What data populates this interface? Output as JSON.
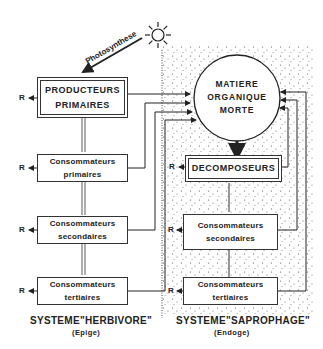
{
  "diagram": {
    "photosynthesis_label": "Photosynthese",
    "sun_icon": "sun-icon",
    "respiration_label": "R",
    "herbivore": {
      "title": "SYSTEME\"HERBIVORE\"",
      "subtitle": "(Epige)",
      "boxes": [
        {
          "line1": "PRODUCTEURS",
          "line2": "PRIMAIRES"
        },
        {
          "line1": "Consommateurs",
          "line2": "primaires"
        },
        {
          "line1": "Consommateurs",
          "line2": "secondaires"
        },
        {
          "line1": "Consommateurs",
          "line2": "tertiaires"
        }
      ]
    },
    "saprophage": {
      "title": "SYSTEME\"SAPROPHAGE\"",
      "subtitle": "(Endoge)",
      "circle": {
        "line1": "MATIERE",
        "line2": "ORGANIQUE",
        "line3": "MORTE"
      },
      "boxes": [
        {
          "line1": "DECOMPOSEURS"
        },
        {
          "line1": "Consommateurs",
          "line2": "secondaires"
        },
        {
          "line1": "Consommateurs",
          "line2": "tertiaires"
        }
      ]
    },
    "colors": {
      "ink": "#222222",
      "background": "#ffffff",
      "stipple": "#555555"
    }
  }
}
